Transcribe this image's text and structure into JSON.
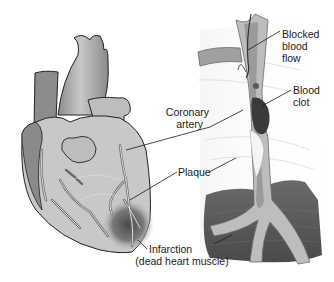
{
  "figure": {
    "left_panel": "heart-anterior-view",
    "right_panel": "coronary-artery-cross-section"
  },
  "labels": {
    "blocked_flow": {
      "line1": "Blocked",
      "line2": "blood",
      "line3": "flow"
    },
    "blood_clot": {
      "line1": "Blood",
      "line2": "clot"
    },
    "coronary_artery": {
      "line1": "Coronary",
      "line2": "artery"
    },
    "plaque": {
      "line1": "Plaque"
    },
    "infarction": {
      "line1": "Infarction",
      "line2": "(dead heart muscle)"
    }
  },
  "colors": {
    "background": "#ffffff",
    "heart_dark": "#7a7a7a",
    "heart_mid": "#a6a6a6",
    "heart_light": "#d4d4d4",
    "artery_wall": "#b8b8b8",
    "clot": "#3a3a3a",
    "plaque": "#f2f2f2",
    "muscle_dark": "#5a5a5a",
    "line": "#1a1a1a"
  }
}
